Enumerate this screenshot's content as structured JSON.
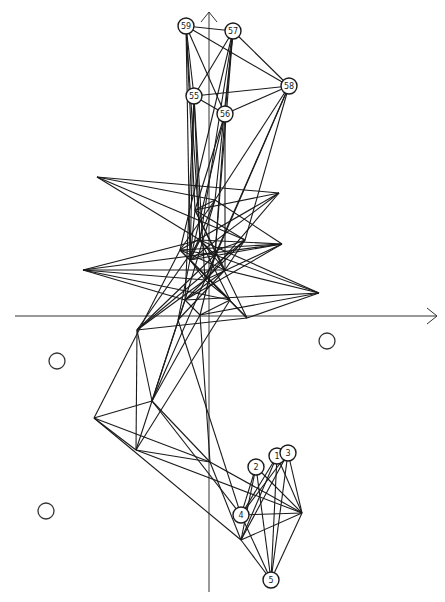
{
  "figure": {
    "type": "network-trajectory-plot",
    "axes": {
      "x_axis": {
        "from": [
          15,
          316
        ],
        "to": [
          437,
          316
        ],
        "arrow": "right"
      },
      "y_axis": {
        "from": [
          209,
          592
        ],
        "to": [
          209,
          12
        ],
        "arrow": "up"
      }
    },
    "labeled_nodes": [
      {
        "label": "59",
        "x": 186,
        "y": 26
      },
      {
        "label": "57",
        "x": 233,
        "y": 31
      },
      {
        "label": "58",
        "x": 289,
        "y": 86
      },
      {
        "label": "55",
        "x": 194,
        "y": 96
      },
      {
        "label": "56",
        "x": 225,
        "y": 114
      },
      {
        "label": "1",
        "x": 277,
        "y": 456
      },
      {
        "label": "3",
        "x": 288,
        "y": 453
      },
      {
        "label": "2",
        "x": 256,
        "y": 467
      },
      {
        "label": "4",
        "x": 241,
        "y": 515
      },
      {
        "label": "5",
        "x": 271,
        "y": 580
      }
    ],
    "empty_circles": [
      {
        "x": 327,
        "y": 341
      },
      {
        "x": 57,
        "y": 361
      },
      {
        "x": 46,
        "y": 511
      }
    ],
    "vertices": {
      "top_a": [
        194,
        96
      ],
      "top_b": [
        225,
        114
      ],
      "top_c": [
        233,
        31
      ],
      "top_d": [
        186,
        26
      ],
      "top_e": [
        289,
        86
      ],
      "p1": [
        97,
        177
      ],
      "p2": [
        279,
        193
      ],
      "p3": [
        282,
        244
      ],
      "p4": [
        83,
        270
      ],
      "p5": [
        319,
        293
      ],
      "c1": [
        200,
        240
      ],
      "c2": [
        190,
        260
      ],
      "c3": [
        215,
        255
      ],
      "c4": [
        205,
        280
      ],
      "c5": [
        185,
        300
      ],
      "c6": [
        225,
        270
      ],
      "c7": [
        245,
        240
      ],
      "c8": [
        195,
        210
      ],
      "c9": [
        215,
        200
      ],
      "c10": [
        180,
        250
      ],
      "c11": [
        230,
        300
      ],
      "c12": [
        200,
        315
      ],
      "m1": [
        137,
        330
      ],
      "m2": [
        247,
        318
      ],
      "m3": [
        152,
        401
      ],
      "m4": [
        94,
        418
      ],
      "m5": [
        136,
        450
      ],
      "m6": [
        210,
        462
      ],
      "m7": [
        178,
        320
      ],
      "b1": [
        302,
        513
      ],
      "b2": [
        241,
        540
      ],
      "b3": [
        271,
        580
      ],
      "b4": [
        241,
        515
      ],
      "b5": [
        277,
        456
      ],
      "b6": [
        288,
        453
      ],
      "b7": [
        256,
        467
      ]
    },
    "edges": [
      [
        "top_d",
        "top_c"
      ],
      [
        "top_d",
        "top_e"
      ],
      [
        "top_c",
        "top_e"
      ],
      [
        "top_d",
        "top_a"
      ],
      [
        "top_d",
        "top_b"
      ],
      [
        "top_c",
        "top_a"
      ],
      [
        "top_c",
        "top_b"
      ],
      [
        "top_e",
        "top_a"
      ],
      [
        "top_e",
        "top_b"
      ],
      [
        "top_a",
        "top_b"
      ],
      [
        "top_d",
        "c8"
      ],
      [
        "top_d",
        "c1"
      ],
      [
        "top_d",
        "c2"
      ],
      [
        "top_c",
        "c9"
      ],
      [
        "top_c",
        "c1"
      ],
      [
        "top_c",
        "c3"
      ],
      [
        "top_c",
        "c10"
      ],
      [
        "top_e",
        "c7"
      ],
      [
        "top_e",
        "c3"
      ],
      [
        "top_e",
        "c4"
      ],
      [
        "top_e",
        "c9"
      ],
      [
        "top_a",
        "c1"
      ],
      [
        "top_a",
        "c2"
      ],
      [
        "top_a",
        "c4"
      ],
      [
        "top_a",
        "c5"
      ],
      [
        "top_b",
        "c3"
      ],
      [
        "top_b",
        "c6"
      ],
      [
        "top_b",
        "c8"
      ],
      [
        "top_b",
        "c2"
      ],
      [
        "p1",
        "p2"
      ],
      [
        "p1",
        "c1"
      ],
      [
        "p1",
        "c9"
      ],
      [
        "p1",
        "c7"
      ],
      [
        "p2",
        "c8"
      ],
      [
        "p2",
        "c2"
      ],
      [
        "p2",
        "c10"
      ],
      [
        "p2",
        "c4"
      ],
      [
        "p3",
        "c1"
      ],
      [
        "p3",
        "c2"
      ],
      [
        "p3",
        "c10"
      ],
      [
        "p3",
        "c9"
      ],
      [
        "p3",
        "c5"
      ],
      [
        "p3",
        "c4"
      ],
      [
        "p4",
        "c1"
      ],
      [
        "p4",
        "c4"
      ],
      [
        "p4",
        "c11"
      ],
      [
        "p4",
        "c5"
      ],
      [
        "p4",
        "c6"
      ],
      [
        "p4",
        "p3"
      ],
      [
        "p5",
        "c1"
      ],
      [
        "p5",
        "c3"
      ],
      [
        "p5",
        "c5"
      ],
      [
        "p5",
        "c12"
      ],
      [
        "p5",
        "m2"
      ],
      [
        "p5",
        "c6"
      ],
      [
        "c1",
        "c2"
      ],
      [
        "c1",
        "c3"
      ],
      [
        "c2",
        "c4"
      ],
      [
        "c3",
        "c4"
      ],
      [
        "c4",
        "c5"
      ],
      [
        "c5",
        "c6"
      ],
      [
        "c6",
        "c7"
      ],
      [
        "c7",
        "c8"
      ],
      [
        "c8",
        "c9"
      ],
      [
        "c9",
        "c10"
      ],
      [
        "c10",
        "c11"
      ],
      [
        "c11",
        "c12"
      ],
      [
        "c1",
        "c6"
      ],
      [
        "c2",
        "c7"
      ],
      [
        "c3",
        "c10"
      ],
      [
        "c4",
        "c11"
      ],
      [
        "c5",
        "c12"
      ],
      [
        "c8",
        "c2"
      ],
      [
        "c9",
        "c5"
      ],
      [
        "c10",
        "c6"
      ],
      [
        "c7",
        "c4"
      ],
      [
        "c1",
        "c11"
      ],
      [
        "c3",
        "c12"
      ],
      [
        "c2",
        "c9"
      ],
      [
        "c6",
        "c8"
      ],
      [
        "m1",
        "c1"
      ],
      [
        "m1",
        "c4"
      ],
      [
        "m1",
        "c7"
      ],
      [
        "m1",
        "m2"
      ],
      [
        "m1",
        "c3"
      ],
      [
        "m2",
        "c2"
      ],
      [
        "m2",
        "c10"
      ],
      [
        "m2",
        "c8"
      ],
      [
        "m7",
        "c6"
      ],
      [
        "m7",
        "c2"
      ],
      [
        "m1",
        "m3"
      ],
      [
        "m1",
        "m5"
      ],
      [
        "m3",
        "c4"
      ],
      [
        "m3",
        "c5"
      ],
      [
        "m3",
        "c12"
      ],
      [
        "m5",
        "c11"
      ],
      [
        "m5",
        "c5"
      ],
      [
        "m3",
        "m4"
      ],
      [
        "m4",
        "m5"
      ],
      [
        "m4",
        "m6"
      ],
      [
        "m3",
        "m6"
      ],
      [
        "m4",
        "c10"
      ],
      [
        "m6",
        "c12"
      ],
      [
        "m4",
        "b2"
      ],
      [
        "m5",
        "b1"
      ],
      [
        "m3",
        "b4"
      ],
      [
        "m6",
        "b1"
      ],
      [
        "m6",
        "b2"
      ],
      [
        "m5",
        "m6"
      ],
      [
        "m7",
        "b4"
      ],
      [
        "b1",
        "b2"
      ],
      [
        "b1",
        "b3"
      ],
      [
        "b1",
        "b4"
      ],
      [
        "b1",
        "b5"
      ],
      [
        "b1",
        "b6"
      ],
      [
        "b1",
        "b7"
      ],
      [
        "b2",
        "b3"
      ],
      [
        "b2",
        "b5"
      ],
      [
        "b2",
        "b6"
      ],
      [
        "b3",
        "b4"
      ],
      [
        "b3",
        "b5"
      ],
      [
        "b3",
        "b6"
      ],
      [
        "b3",
        "b7"
      ],
      [
        "b4",
        "b5"
      ],
      [
        "b4",
        "b6"
      ],
      [
        "b4",
        "b7"
      ],
      [
        "b5",
        "b6"
      ],
      [
        "b2",
        "b7"
      ]
    ]
  }
}
